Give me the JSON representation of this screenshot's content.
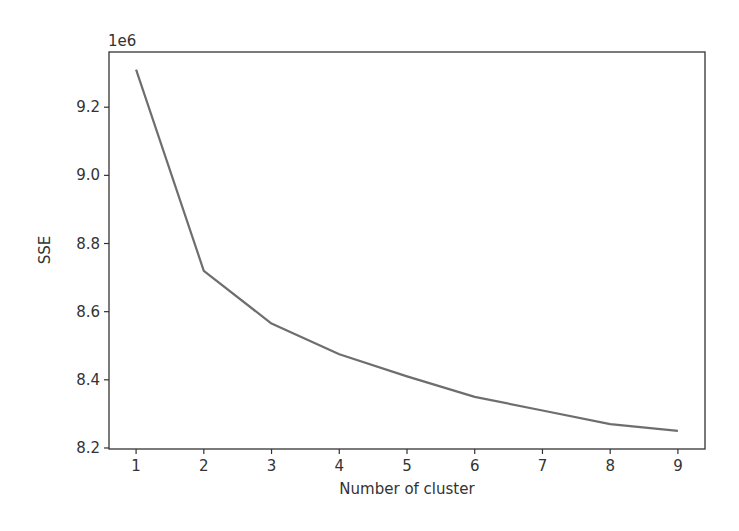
{
  "chart_data": {
    "type": "line",
    "title": "",
    "xlabel": "Number of cluster",
    "ylabel": "SSE",
    "y_offset_label": "1e6",
    "x": [
      1,
      2,
      3,
      4,
      5,
      6,
      7,
      8,
      9
    ],
    "values": [
      9.31,
      8.72,
      8.565,
      8.475,
      8.41,
      8.35,
      8.31,
      8.27,
      8.25
    ],
    "series": [
      {
        "name": "SSE",
        "color": "#6e6e6e",
        "values": [
          9310000,
          8720000,
          8565000,
          8475000,
          8410000,
          8350000,
          8310000,
          8270000,
          8250000
        ]
      }
    ],
    "x_ticks": [
      "1",
      "2",
      "3",
      "4",
      "5",
      "6",
      "7",
      "8",
      "9"
    ],
    "y_ticks": [
      "8.2",
      "8.4",
      "8.6",
      "8.8",
      "9.0",
      "9.2"
    ],
    "xlim": [
      0.6,
      9.4
    ],
    "ylim": [
      8.197,
      9.362
    ],
    "grid": false,
    "legend": null
  }
}
